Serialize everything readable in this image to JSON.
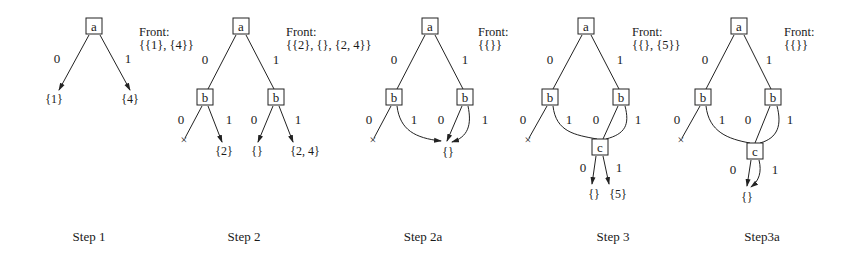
{
  "figure": {
    "steps": [
      {
        "caption": "Step 1",
        "front_title": "Front:",
        "front_value": "{{1}, {4}}",
        "nodes": {
          "a": "a"
        },
        "edge_labels": {
          "a0": "0",
          "a1": "1"
        },
        "leaves": {
          "l0": "{1}",
          "l1": "{4}"
        }
      },
      {
        "caption": "Step 2",
        "front_title": "Front:",
        "front_value": "{{2}, {}, {2, 4}}",
        "nodes": {
          "a": "a",
          "b_left": "b",
          "b_right": "b"
        },
        "edge_labels": {
          "a0": "0",
          "a1": "1",
          "bl0": "0",
          "bl1": "1",
          "br0": "0",
          "br1": "1"
        },
        "leaves": {
          "x": "×",
          "l1": "{2}",
          "l2": "{}",
          "l3": "{2, 4}"
        }
      },
      {
        "caption": "Step 2a",
        "front_title": "Front:",
        "front_value": "{{}}",
        "nodes": {
          "a": "a",
          "b_left": "b",
          "b_right": "b"
        },
        "edge_labels": {
          "a0": "0",
          "a1": "1",
          "bl0": "0",
          "bl1": "1",
          "br0": "0",
          "br1": "1"
        },
        "leaves": {
          "x": "×",
          "merged": "{}"
        }
      },
      {
        "caption": "Step 3",
        "front_title": "Front:",
        "front_value": "{{}, {5}}",
        "nodes": {
          "a": "a",
          "b_left": "b",
          "b_right": "b",
          "c": "c"
        },
        "edge_labels": {
          "a0": "0",
          "a1": "1",
          "bl0": "0",
          "bl1": "1",
          "br0": "0",
          "br1": "1",
          "c0": "0",
          "c1": "1"
        },
        "leaves": {
          "x": "×",
          "c0": "{}",
          "c1": "{5}"
        }
      },
      {
        "caption": "Step3a",
        "front_title": "Front:",
        "front_value": "{{}}",
        "nodes": {
          "a": "a",
          "b_left": "b",
          "b_right": "b",
          "c": "c"
        },
        "edge_labels": {
          "a0": "0",
          "a1": "1",
          "bl0": "0",
          "bl1": "1",
          "br0": "0",
          "br1": "1",
          "c0": "0",
          "c1": "1"
        },
        "leaves": {
          "x": "×",
          "merged": "{}"
        }
      }
    ]
  }
}
